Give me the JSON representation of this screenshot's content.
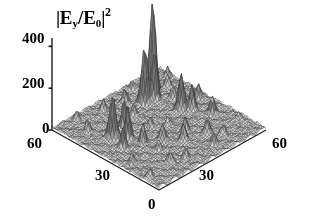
{
  "figure": {
    "width": 309,
    "height": 224,
    "background": "#ffffff",
    "foreground": "#000000"
  },
  "title": {
    "full_text": "|Ey/E0|^2",
    "bar_left": "|",
    "e_main": "E",
    "e_sub": "y",
    "slash": "/",
    "e2_main": "E",
    "e2_sub": "0",
    "bar_right": "|",
    "exponent": "2"
  },
  "axes": {
    "z": {
      "label": "",
      "ticks": [
        "400",
        "200",
        "0"
      ],
      "tick_values": [
        400,
        200,
        0
      ],
      "range": [
        0,
        440
      ]
    },
    "y": {
      "label": "",
      "ticks": [
        "60",
        "30",
        "0"
      ],
      "tick_values": [
        60,
        30,
        0
      ],
      "range": [
        0,
        60
      ]
    },
    "x": {
      "label": "",
      "ticks": [
        "0",
        "30",
        "60"
      ],
      "tick_values": [
        0,
        30,
        60
      ],
      "range": [
        0,
        60
      ]
    }
  },
  "tick_labels": {
    "z_400": "400",
    "z_200": "200",
    "z_0": "0",
    "y_60": "60",
    "y_30": "30",
    "origin_0": "0",
    "x_30": "30",
    "x_60": "60"
  },
  "style": {
    "mesh_line_color": "#3c3c3c",
    "mesh_fill_light": "#e2e2e2",
    "mesh_fill_dark": "#8a8a8a",
    "axis_color": "#1a1a1a",
    "grid": true,
    "legend": "none"
  },
  "chart_data": {
    "type": "surface",
    "xlabel": "",
    "ylabel": "",
    "zlabel": "|Ey/E0|^2",
    "xlim": [
      0,
      60
    ],
    "ylim": [
      0,
      60
    ],
    "zlim": [
      0,
      440
    ],
    "x_ticks": [
      0,
      30,
      60
    ],
    "y_ticks": [
      0,
      30,
      60
    ],
    "z_ticks": [
      0,
      200,
      400
    ],
    "grid": true,
    "legend_position": "none",
    "colormap": "grayscale",
    "mesh_resolution": [
      62,
      62
    ],
    "baseline": 8,
    "peaks": [
      {
        "x": 46.5,
        "y": 50.0,
        "z": 430,
        "width": 1.7,
        "label": "tallest peak"
      },
      {
        "x": 39.0,
        "y": 47.0,
        "z": 272,
        "width": 1.7,
        "label": "second peak"
      },
      {
        "x": 43.0,
        "y": 45.5,
        "z": 228,
        "width": 1.5,
        "label": "third peak"
      },
      {
        "x": 12.0,
        "y": 38.0,
        "z": 205,
        "width": 1.8,
        "label": "left tall peak"
      },
      {
        "x": 15.5,
        "y": 33.0,
        "z": 150,
        "width": 1.5,
        "label": "left mid peak"
      },
      {
        "x": 20.5,
        "y": 40.0,
        "z": 138,
        "width": 1.4,
        "label": "left back peak"
      },
      {
        "x": 45.5,
        "y": 33.0,
        "z": 170,
        "width": 1.7,
        "label": "right front peak"
      },
      {
        "x": 48.5,
        "y": 30.0,
        "z": 120,
        "width": 1.4
      },
      {
        "x": 10.0,
        "y": 30.0,
        "z": 95,
        "width": 1.3
      },
      {
        "x": 18.0,
        "y": 27.0,
        "z": 88,
        "width": 1.3
      },
      {
        "x": 25.0,
        "y": 23.0,
        "z": 78,
        "width": 1.4
      },
      {
        "x": 31.0,
        "y": 17.0,
        "z": 72,
        "width": 1.4
      },
      {
        "x": 36.0,
        "y": 21.0,
        "z": 66,
        "width": 1.3
      },
      {
        "x": 41.0,
        "y": 14.0,
        "z": 70,
        "width": 1.4
      },
      {
        "x": 52.0,
        "y": 22.0,
        "z": 84,
        "width": 1.5
      },
      {
        "x": 56.0,
        "y": 34.0,
        "z": 70,
        "width": 1.4
      },
      {
        "x": 29.0,
        "y": 43.0,
        "z": 60,
        "width": 1.3
      },
      {
        "x": 33.0,
        "y": 52.0,
        "z": 58,
        "width": 1.3
      },
      {
        "x": 23.0,
        "y": 54.0,
        "z": 52,
        "width": 1.2
      },
      {
        "x": 8.0,
        "y": 48.0,
        "z": 55,
        "width": 1.2
      },
      {
        "x": 53.0,
        "y": 48.0,
        "z": 62,
        "width": 1.3
      },
      {
        "x": 58.0,
        "y": 53.0,
        "z": 48,
        "width": 1.2
      },
      {
        "x": 16.0,
        "y": 10.0,
        "z": 50,
        "width": 1.3
      },
      {
        "x": 22.0,
        "y": 7.0,
        "z": 46,
        "width": 1.2
      },
      {
        "x": 37.0,
        "y": 6.0,
        "z": 54,
        "width": 1.3
      },
      {
        "x": 45.0,
        "y": 9.0,
        "z": 44,
        "width": 1.2
      },
      {
        "x": 5.0,
        "y": 20.0,
        "z": 42,
        "width": 1.2
      },
      {
        "x": 28.0,
        "y": 33.0,
        "z": 46,
        "width": 1.2
      },
      {
        "x": 49.0,
        "y": 41.0,
        "z": 54,
        "width": 1.3
      },
      {
        "x": 11.0,
        "y": 57.0,
        "z": 40,
        "width": 1.2
      },
      {
        "x": 42.0,
        "y": 57.0,
        "z": 44,
        "width": 1.2
      },
      {
        "x": 57.0,
        "y": 12.0,
        "z": 38,
        "width": 1.2
      },
      {
        "x": 3.0,
        "y": 8.0,
        "z": 36,
        "width": 1.2
      },
      {
        "x": 19.0,
        "y": 19.0,
        "z": 40,
        "width": 1.2
      },
      {
        "x": 34.0,
        "y": 29.0,
        "z": 38,
        "width": 1.2
      }
    ]
  }
}
